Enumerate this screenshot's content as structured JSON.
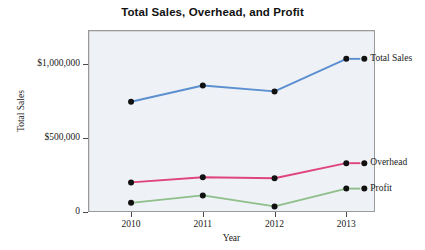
{
  "chart_data": {
    "type": "line",
    "title": "Total Sales, Overhead, and Profit",
    "xlabel": "Year",
    "ylabel": "Total Sales",
    "categories": [
      "2010",
      "2011",
      "2012",
      "2013"
    ],
    "x": [
      2010,
      2011,
      2012,
      2013
    ],
    "xlim": [
      2009.4,
      2013.4
    ],
    "ylim": [
      0,
      1230000
    ],
    "grid": false,
    "legend_position": "right-inline",
    "y_ticks": [
      {
        "value": 0,
        "label": "0"
      },
      {
        "value": 500000,
        "label": "$500,000"
      },
      {
        "value": 1000000,
        "label": "$1,000,000"
      }
    ],
    "x_ticks": [
      {
        "value": 2010,
        "label": "2010"
      },
      {
        "value": 2011,
        "label": "2011"
      },
      {
        "value": 2012,
        "label": "2012"
      },
      {
        "value": 2013,
        "label": "2013"
      }
    ],
    "series": [
      {
        "name": "Total Sales",
        "color": "#5b8fd0",
        "marker_color": "#111111",
        "values": [
          745000,
          855000,
          815000,
          1035000
        ]
      },
      {
        "name": "Overhead",
        "color": "#e0447c",
        "marker_color": "#111111",
        "values": [
          200000,
          235000,
          228000,
          330000
        ]
      },
      {
        "name": "Profit",
        "color": "#8fbf8a",
        "marker_color": "#111111",
        "values": [
          62000,
          112000,
          38000,
          158000
        ]
      }
    ]
  },
  "colors": {
    "plot_background": "#eef1f5",
    "plot_border": "#9a9a9a",
    "page_background": "#ffffff",
    "text": "#1a1a1a",
    "total_sales": "#5b8fd0",
    "overhead": "#e0447c",
    "profit": "#8fbf8a",
    "marker": "#111111"
  }
}
